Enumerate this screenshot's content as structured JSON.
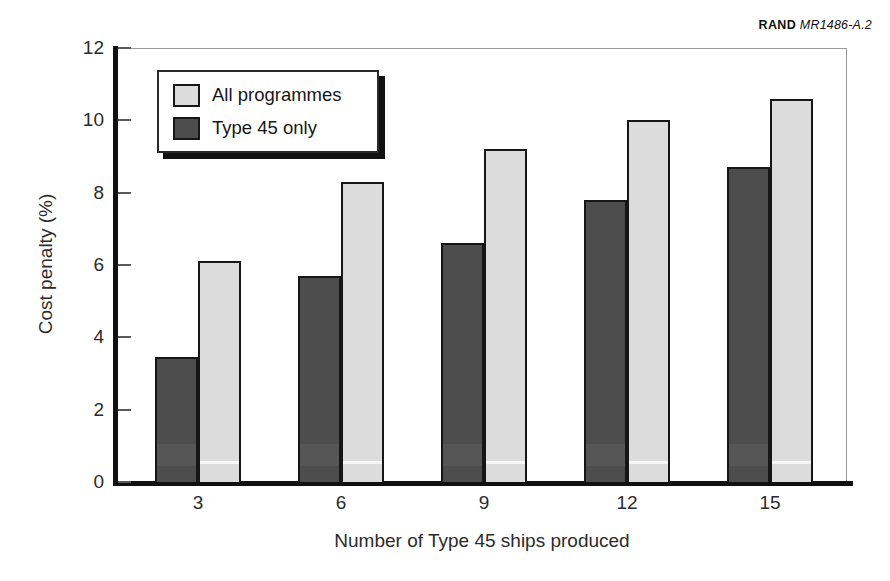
{
  "credit": {
    "organization": "RAND",
    "document_code": "MR1486-A.2"
  },
  "chart_data": {
    "type": "bar",
    "title": "",
    "subtitle": "",
    "xlabel": "Number of Type 45 ships produced",
    "ylabel": "Cost penalty (%)",
    "categories": [
      "3",
      "6",
      "9",
      "12",
      "15"
    ],
    "series": [
      {
        "name": "Type 45 only",
        "color": "#4d4d4d",
        "values": [
          3.45,
          5.7,
          6.6,
          7.8,
          8.7
        ]
      },
      {
        "name": "All programmes",
        "color": "#dcdcdc",
        "values": [
          6.1,
          8.3,
          9.2,
          10.0,
          10.6
        ]
      }
    ],
    "ylim": [
      0,
      12
    ],
    "yticks": [
      0,
      2,
      4,
      6,
      8,
      10,
      12
    ],
    "ytick_labels": [
      "0",
      "2",
      "4",
      "6",
      "8",
      "10",
      "12"
    ],
    "grid": false,
    "legend_position": "top-left",
    "legend_entries": [
      "All programmes",
      "Type 45 only"
    ],
    "bar_group_order": [
      "Type 45 only",
      "All programmes"
    ]
  },
  "legend": {
    "items": [
      {
        "label": "All programmes",
        "swatch": "series-all"
      },
      {
        "label": "Type 45 only",
        "swatch": "series-t45"
      }
    ]
  },
  "colors": {
    "series_all_programmes": "#dcdcdc",
    "series_type45_only": "#4d4d4d",
    "axis": "#111111",
    "frame": "#9a9a9a",
    "text": "#2b2b2b",
    "background": "#ffffff"
  }
}
